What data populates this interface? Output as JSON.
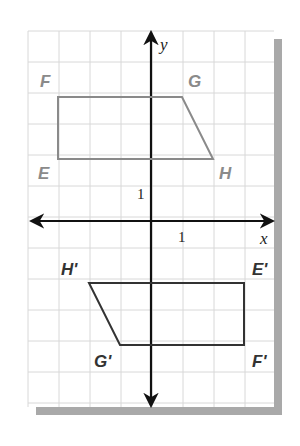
{
  "diagram": {
    "type": "coordinate-plane-reflection",
    "grid": {
      "x_min": -4,
      "x_max": 4,
      "y_min": -6,
      "y_max": 6,
      "unit_px": 31,
      "origin_px": [
        151,
        221
      ],
      "left_px": 28,
      "top_px": 31,
      "right_px": 274,
      "bottom_px": 407,
      "grid_color": "#d8d8d8",
      "shadow_color": "#a9a9a9"
    },
    "axes": {
      "x_label": "x",
      "y_label": "y",
      "x_tick_label": "1",
      "y_tick_label": "1",
      "color": "#111111"
    },
    "original_figure": {
      "name": "EFGH",
      "color": "#8a8a8a",
      "vertices": [
        {
          "label": "F",
          "x": -3,
          "y": 4
        },
        {
          "label": "G",
          "x": 1,
          "y": 4
        },
        {
          "label": "H",
          "x": 2,
          "y": 2
        },
        {
          "label": "E",
          "x": -3,
          "y": 2
        }
      ]
    },
    "image_figure": {
      "name": "E'F'G'H'",
      "color": "#333333",
      "vertices": [
        {
          "label": "H'",
          "x": -2,
          "y": -2
        },
        {
          "label": "E'",
          "x": 3,
          "y": -2
        },
        {
          "label": "F'",
          "x": 3,
          "y": -4
        },
        {
          "label": "G'",
          "x": -1,
          "y": -4
        }
      ]
    }
  }
}
